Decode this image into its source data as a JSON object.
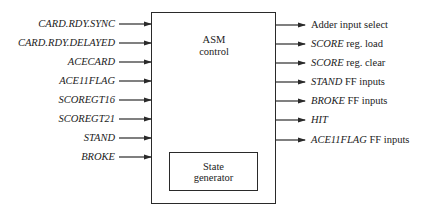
{
  "diagram": {
    "main_block": {
      "line1": "ASM",
      "line2": "control"
    },
    "sub_block": {
      "line1": "State",
      "line2": "generator"
    },
    "inputs": [
      {
        "label": "CARD.RDY.SYNC"
      },
      {
        "label": "CARD.RDY.DELAYED"
      },
      {
        "label": "ACECARD"
      },
      {
        "label": "ACE11FLAG"
      },
      {
        "label": "SCOREGT16"
      },
      {
        "label": "SCOREGT21"
      },
      {
        "label": "STAND"
      },
      {
        "label": "BROKE"
      }
    ],
    "outputs": [
      {
        "italic": "",
        "plain": "Adder input select"
      },
      {
        "italic": "SCORE",
        "plain": " reg. load"
      },
      {
        "italic": "SCORE",
        "plain": " reg. clear"
      },
      {
        "italic": "STAND",
        "plain": " FF inputs"
      },
      {
        "italic": "BROKE",
        "plain": " FF inputs"
      },
      {
        "italic": "HIT",
        "plain": ""
      },
      {
        "italic": "ACE11FLAG",
        "plain": " FF inputs"
      }
    ],
    "colors": {
      "line": "#2a2a2a",
      "text": "#222222"
    }
  }
}
